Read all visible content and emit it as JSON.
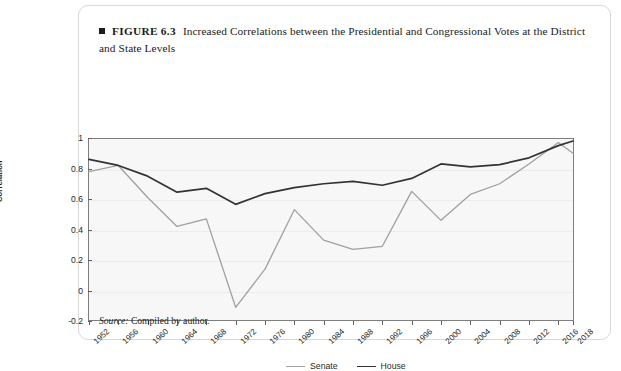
{
  "figure": {
    "number": "FIGURE 6.3",
    "caption": "Increased Correlations between the Presidential and Congressional Votes at the District and State Levels",
    "source_label": "Source:",
    "source_text": "Compiled by author."
  },
  "colors": {
    "senate_line": "#a0a0a0",
    "house_line": "#333333",
    "plot_background": "#f7f7f7",
    "plot_border": "#7d7d7d",
    "gridline": "#ececec",
    "text": "#1b1b1b",
    "card_border": "#d8d8d8"
  },
  "chart_data": {
    "type": "line",
    "title": "Increased Correlations between the Presidential and Congressional Votes at the District and State Levels",
    "xlabel": "",
    "ylabel": "Correlation",
    "ylim": [
      -0.2,
      1.0
    ],
    "yticks": [
      1,
      0.8,
      0.6,
      0.4,
      0.2,
      0,
      -0.2
    ],
    "ytick_labels": [
      "1",
      "0.8",
      "0.6",
      "0.4",
      "0.2",
      "0",
      "-0.2"
    ],
    "grid": true,
    "legend_position": "bottom-center",
    "x": [
      1952,
      1956,
      1960,
      1964,
      1968,
      1972,
      1976,
      1980,
      1984,
      1988,
      1992,
      1996,
      2000,
      2004,
      2008,
      2012,
      2016,
      2018
    ],
    "categories": [
      "1952",
      "1956",
      "1960",
      "1964",
      "1968",
      "1972",
      "1976",
      "1980",
      "1984",
      "1988",
      "1992",
      "1996",
      "2000",
      "2004",
      "2008",
      "2012",
      "2016",
      "2018"
    ],
    "series": [
      {
        "name": "Senate",
        "color": "#a0a0a0",
        "values": [
          0.78,
          0.82,
          0.61,
          0.42,
          0.47,
          -0.11,
          0.14,
          0.53,
          0.33,
          0.27,
          0.29,
          0.65,
          0.46,
          0.63,
          0.7,
          0.83,
          0.97,
          0.9
        ]
      },
      {
        "name": "House",
        "color": "#333333",
        "values": [
          0.86,
          0.82,
          0.75,
          0.645,
          0.67,
          0.565,
          0.635,
          0.675,
          0.7,
          0.715,
          0.69,
          0.735,
          0.83,
          0.81,
          0.825,
          0.87,
          0.95,
          0.98
        ]
      }
    ]
  },
  "legend": {
    "items": [
      {
        "label": "Senate",
        "color": "#a0a0a0"
      },
      {
        "label": "House",
        "color": "#333333"
      }
    ]
  }
}
